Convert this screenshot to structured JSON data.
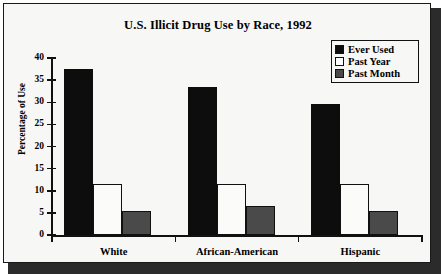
{
  "chart_data": {
    "type": "bar",
    "title": "U.S. Illicit Drug Use by Race, 1992",
    "xlabel": "",
    "ylabel": "Percentage of Use",
    "ylim": [
      0,
      40
    ],
    "yticks": [
      0,
      5,
      10,
      15,
      20,
      25,
      30,
      35,
      40
    ],
    "ytick_labels": [
      "0",
      "5",
      "10",
      "15",
      "20",
      "25",
      "30",
      "35",
      "40"
    ],
    "grid": false,
    "legend_position": "top-right",
    "categories": [
      "White",
      "African-American",
      "Hispanic"
    ],
    "series": [
      {
        "name": "Ever Used",
        "values": [
          37.5,
          33.5,
          29.5
        ],
        "color": "#0d0d0d"
      },
      {
        "name": "Past Year",
        "values": [
          11.5,
          11.5,
          11.5
        ],
        "color": "#ffffff"
      },
      {
        "name": "Past Month",
        "values": [
          5.5,
          6.5,
          5.5
        ],
        "color": "#4a4a4a"
      }
    ]
  },
  "legend": {
    "items": [
      {
        "label": "Ever Used"
      },
      {
        "label": "Past Year"
      },
      {
        "label": "Past Month"
      }
    ]
  }
}
